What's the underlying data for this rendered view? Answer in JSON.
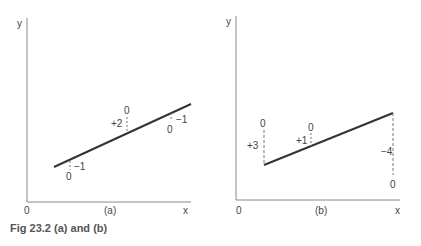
{
  "caption": "Fig 23.2 (a) and (b)",
  "panels": [
    {
      "id": "a",
      "label": "(a)",
      "axes": {
        "y": "y",
        "x": "x",
        "origin": "0"
      },
      "line": {
        "from": [
          54,
          167
        ],
        "to": [
          191,
          104
        ]
      },
      "markers": [
        {
          "base": "0",
          "deviation": "−1"
        },
        {
          "base": "0",
          "deviation": "+2"
        },
        {
          "base": "0",
          "deviation": "−1"
        }
      ]
    },
    {
      "id": "b",
      "label": "(b)",
      "axes": {
        "y": "y",
        "x": "x",
        "origin": "0"
      },
      "line": {
        "from": [
          264,
          165
        ],
        "to": [
          393,
          113
        ]
      },
      "markers": [
        {
          "base": "0",
          "deviation": "+3"
        },
        {
          "base": "0",
          "deviation": "+1"
        },
        {
          "base": "0",
          "deviation": "−4"
        }
      ]
    }
  ],
  "colors": {
    "line": "#333333",
    "axis": "#888888",
    "dashed": "#777777"
  }
}
